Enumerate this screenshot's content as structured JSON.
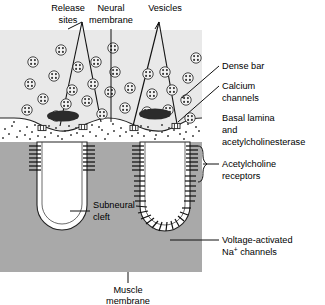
{
  "figure": {
    "type": "biological-diagram",
    "background_color": "#ffffff"
  },
  "colors": {
    "nerve_terminal_fill": "#e9e9e9",
    "muscle_fill": "#a9a9a9",
    "cleft_fill": "#ffffff",
    "dense_bar_fill": "#2b2b2b",
    "stroke": "#1a1a1a",
    "text": "#000000"
  },
  "labels": {
    "release_sites": {
      "line1": "Release",
      "line2": "sites"
    },
    "neural_membrane": {
      "line1": "Neural",
      "line2": "membrane"
    },
    "vesicles": {
      "line1": "Vesicles"
    },
    "dense_bar": {
      "line1": "Dense bar"
    },
    "calcium_channels": {
      "line1": "Calcium",
      "line2": "channels"
    },
    "basal_lamina": {
      "line1": "Basal lamina",
      "line2": "and",
      "line3": "acetylcholinesterase"
    },
    "acetylcholine_receptors": {
      "line1": "Acetylcholine",
      "line2": "receptors"
    },
    "subneural_cleft": {
      "line1": "Subneural",
      "line2": "cleft"
    },
    "voltage_na_channels": {
      "line1": "Voltage-activated",
      "line2_pre": "Na",
      "line2_sup": "+",
      "line2_post": " channels"
    },
    "muscle_membrane": {
      "line1": "Muscle",
      "line2": "membrane"
    }
  },
  "structures": {
    "nerve_terminal": {
      "name": "presynaptic nerve terminal",
      "count": 1
    },
    "release_site_cones": {
      "name": "release site",
      "count": 2
    },
    "dense_bars": {
      "name": "dense bar",
      "count": 2
    },
    "calcium_channel_pairs": {
      "name": "calcium channel",
      "count": 4
    },
    "subneural_clefts": {
      "name": "subneural cleft",
      "count": 2
    },
    "vesicles": {
      "name": "synaptic vesicle",
      "count": 26
    },
    "transmitter_dots": {
      "name": "acetylcholine molecule",
      "count": 120
    }
  }
}
